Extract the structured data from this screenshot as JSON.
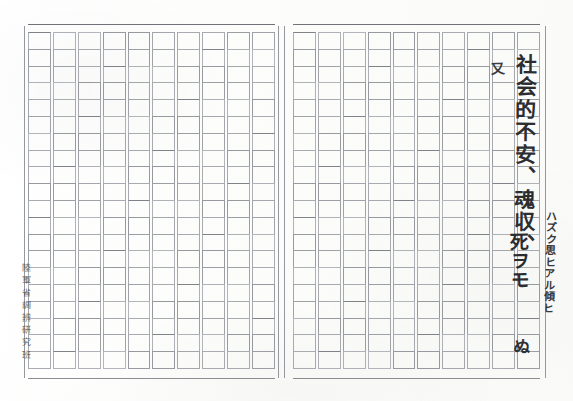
{
  "document": {
    "kind": "genkou-youshi-scan",
    "page_background": "#fdfdfc",
    "rule_color": "#9fa2a7",
    "ink_color": "#2b2d30",
    "sheet": {
      "halves": 2,
      "columns_per_half": 10,
      "rows_per_column": 20,
      "writing_direction": "vertical-right-to-left"
    }
  },
  "institution_stamp": {
    "name": "institution-stamp",
    "text_vertical": "陸軍省調辨研究班",
    "characters": [
      "陸",
      "軍",
      "省",
      "調",
      "辨",
      "研",
      "究",
      "班"
    ]
  },
  "handwriting": {
    "main_column": {
      "label": "main-handwritten-column",
      "text": "社会的不安、魂収、"
    },
    "insert_mark": {
      "label": "inserted-character",
      "text": "又"
    },
    "lower_scrawl": {
      "label": "lower-handwritten-scrawl",
      "text": "死ヲモ"
    },
    "margin_note": {
      "label": "margin-annotation",
      "text": "ハズク思ヒアル傾ヒ"
    },
    "bottom_mark": {
      "label": "bottom-handwritten-mark",
      "text": "ぬ"
    }
  }
}
